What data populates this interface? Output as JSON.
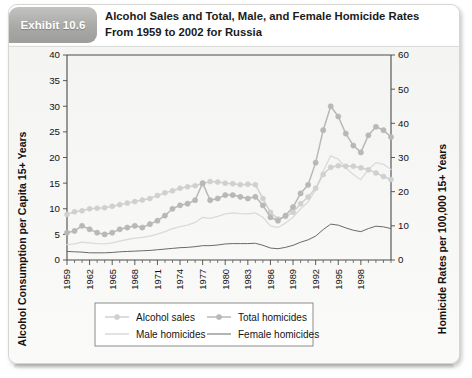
{
  "exhibit": {
    "tab_label": "Exhibit 10.6",
    "title_line1": "Alcohol Sales and Total, Male, and Female Homicide Rates",
    "title_line2": "From 1959 to 2002 for Russia"
  },
  "colors": {
    "alcohol_sales": "#d0d0d0",
    "total_homicides": "#b8b8b8",
    "male_homicides": "#dadada",
    "female_homicides": "#6a6a6a",
    "axis": "#4a4a4a",
    "tab_background": "#a9a9a7",
    "card_background": "#fbfbfa"
  },
  "legend": {
    "items": [
      {
        "label": "Alcohol sales",
        "style": "line-marker",
        "color": "#d0d0d0"
      },
      {
        "label": "Total homicides",
        "style": "line-marker",
        "color": "#b8b8b8"
      },
      {
        "label": "Male homicides",
        "style": "line",
        "color": "#dadada"
      },
      {
        "label": "Female homicides",
        "style": "line",
        "color": "#6a6a6a"
      }
    ]
  },
  "chart_data": {
    "type": "line",
    "title": "Alcohol Sales and Total, Male, and Female Homicide Rates From 1959 to 2002 for Russia",
    "xlabel": "",
    "ylabel": "Alcohol Consumption per Capita 15+ Years",
    "y2label": "Homicide Rates per 100,000 15+ Years",
    "ylim": [
      0,
      40
    ],
    "yticks": [
      0,
      5,
      10,
      15,
      20,
      25,
      30,
      35,
      40
    ],
    "y2lim": [
      0,
      60
    ],
    "y2ticks": [
      0,
      10,
      20,
      30,
      40,
      50,
      60
    ],
    "xlim": [
      1959,
      2002
    ],
    "xticks": [
      1959,
      1962,
      1965,
      1968,
      1971,
      1974,
      1977,
      1980,
      1983,
      1986,
      1989,
      1992,
      1995,
      1998
    ],
    "xtick_labels": [
      "1959",
      "1962",
      "1965",
      "1968",
      "1971",
      "1974",
      "1977",
      "1980",
      "1983",
      "1986",
      "1989",
      "1992",
      "1995",
      "1998"
    ],
    "grid": false,
    "legend_position": "bottom",
    "x": [
      1959,
      1960,
      1961,
      1962,
      1963,
      1964,
      1965,
      1966,
      1967,
      1968,
      1969,
      1970,
      1971,
      1972,
      1973,
      1974,
      1975,
      1976,
      1977,
      1978,
      1979,
      1980,
      1981,
      1982,
      1983,
      1984,
      1985,
      1986,
      1987,
      1988,
      1989,
      1990,
      1991,
      1992,
      1993,
      1994,
      1995,
      1996,
      1997,
      1998,
      1999,
      2000,
      2001,
      2002
    ],
    "series": [
      {
        "name": "Alcohol sales",
        "axis": "left",
        "markers": true,
        "values": [
          8.9,
          9.4,
          9.6,
          10.0,
          10.1,
          10.2,
          10.5,
          10.8,
          11.1,
          11.4,
          11.7,
          12.0,
          12.6,
          13.1,
          13.5,
          14.0,
          14.3,
          14.5,
          14.9,
          15.3,
          15.2,
          15.0,
          14.9,
          14.7,
          14.8,
          14.7,
          12.0,
          9.3,
          8.0,
          8.5,
          9.3,
          11.0,
          12.3,
          14.0,
          16.7,
          18.1,
          18.4,
          18.3,
          18.3,
          18.0,
          17.6,
          17.0,
          16.3,
          15.7
        ]
      },
      {
        "name": "Total homicides",
        "axis": "right",
        "markers": true,
        "values": [
          8.0,
          8.5,
          10.0,
          9.0,
          8.0,
          7.5,
          8.0,
          9.0,
          9.5,
          10.0,
          9.5,
          10.5,
          11.5,
          13.0,
          15.0,
          16.0,
          16.5,
          17.5,
          22.5,
          17.5,
          18.0,
          19.0,
          19.0,
          18.5,
          18.0,
          18.5,
          16.0,
          12.5,
          11.5,
          13.0,
          15.5,
          19.5,
          22.0,
          28.5,
          38.0,
          45.0,
          42.0,
          37.0,
          33.5,
          31.5,
          36.5,
          39.0,
          38.0,
          36.0
        ]
      },
      {
        "name": "Male homicides",
        "axis": "right",
        "markers": false,
        "values": [
          4.5,
          4.7,
          5.2,
          5.0,
          4.8,
          4.7,
          5.0,
          5.5,
          6.0,
          6.4,
          6.6,
          7.0,
          7.6,
          8.3,
          9.2,
          9.8,
          10.2,
          11.0,
          12.5,
          12.2,
          12.8,
          13.5,
          13.8,
          13.6,
          13.5,
          13.8,
          12.5,
          10.0,
          9.5,
          10.8,
          12.5,
          15.0,
          17.0,
          20.5,
          26.0,
          30.5,
          29.5,
          27.0,
          25.0,
          23.5,
          26.5,
          28.5,
          28.0,
          26.5
        ]
      },
      {
        "name": "Female homicides",
        "axis": "right",
        "markers": false,
        "values": [
          2.5,
          2.4,
          2.3,
          2.1,
          2.1,
          2.1,
          2.2,
          2.4,
          2.5,
          2.6,
          2.7,
          2.8,
          3.0,
          3.2,
          3.4,
          3.6,
          3.7,
          3.9,
          4.2,
          4.2,
          4.4,
          4.7,
          4.8,
          4.8,
          4.8,
          4.9,
          4.3,
          3.5,
          3.3,
          3.7,
          4.3,
          5.2,
          5.9,
          7.0,
          8.9,
          10.5,
          10.2,
          9.4,
          8.7,
          8.3,
          9.2,
          9.9,
          9.7,
          9.2
        ]
      }
    ]
  }
}
